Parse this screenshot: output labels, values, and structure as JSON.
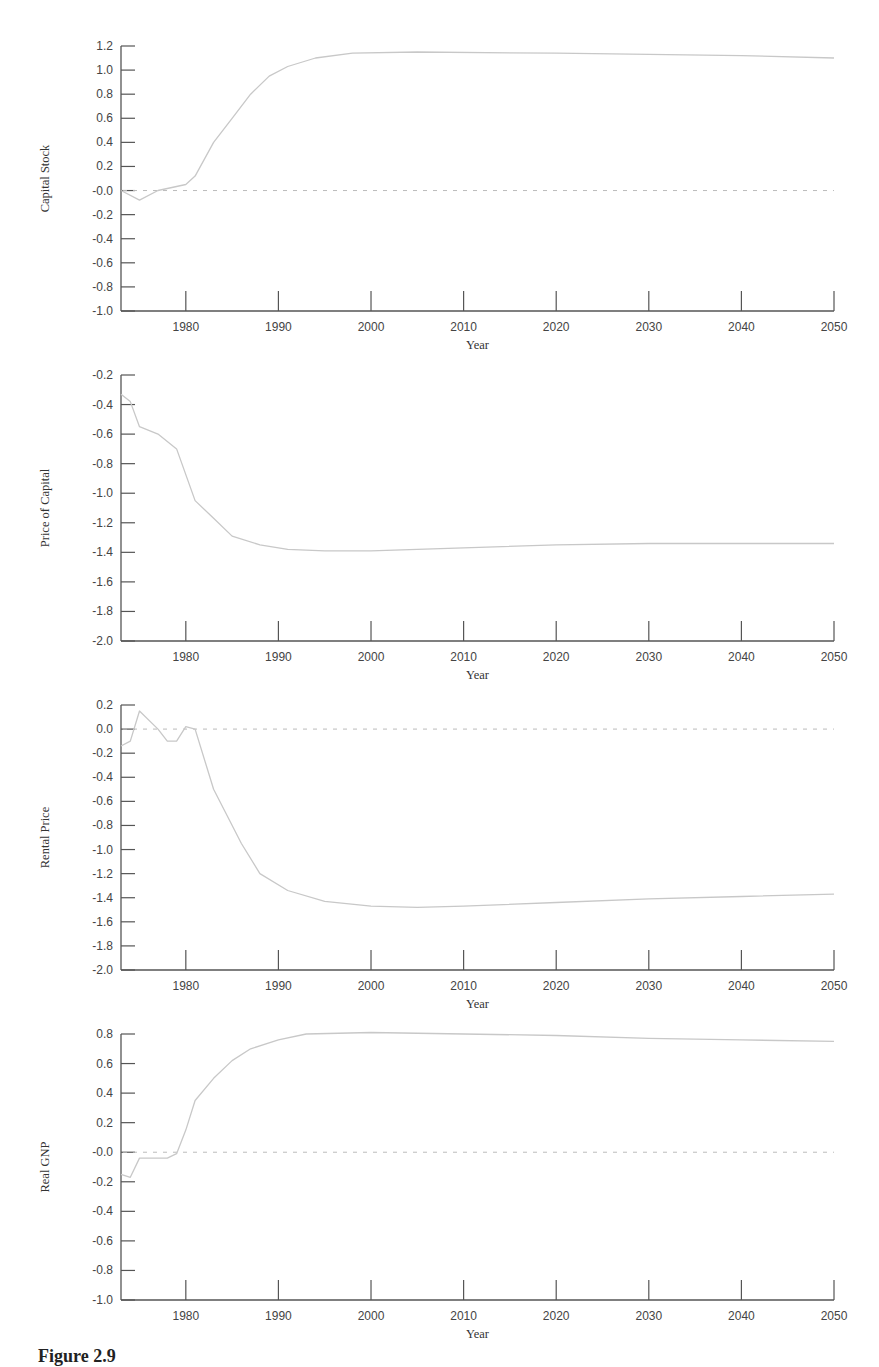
{
  "caption": "Figure 2.9",
  "chart_data": [
    {
      "type": "line",
      "title": "",
      "xlabel": "Year",
      "ylabel": "Capital Stock",
      "xlim": [
        1973,
        2050
      ],
      "ylim": [
        -1.0,
        1.2
      ],
      "yticks": [
        "1.2",
        "1.0",
        "0.8",
        "0.6",
        "0.4",
        "0.2",
        "-0.0",
        "-0.2",
        "-0.4",
        "-0.6",
        "-0.8",
        "-1.0"
      ],
      "xticks": [
        "1980",
        "1990",
        "2000",
        "2010",
        "2020",
        "2030",
        "2040",
        "2050"
      ],
      "zero_line": true,
      "grid": false,
      "x": [
        1973,
        1975,
        1977,
        1980,
        1981,
        1983,
        1985,
        1987,
        1989,
        1991,
        1994,
        1998,
        2005,
        2020,
        2030,
        2040,
        2050
      ],
      "values": [
        0.0,
        -0.08,
        0.0,
        0.05,
        0.12,
        0.4,
        0.6,
        0.8,
        0.95,
        1.03,
        1.1,
        1.14,
        1.15,
        1.14,
        1.13,
        1.12,
        1.1
      ]
    },
    {
      "type": "line",
      "title": "",
      "xlabel": "Year",
      "ylabel": "Price of Capital",
      "xlim": [
        1973,
        2050
      ],
      "ylim": [
        -2.0,
        -0.2
      ],
      "yticks": [
        "-0.2",
        "-0.4",
        "-0.6",
        "-0.8",
        "-1.0",
        "-1.2",
        "-1.4",
        "-1.6",
        "-1.8",
        "-2.0"
      ],
      "xticks": [
        "1980",
        "1990",
        "2000",
        "2010",
        "2020",
        "2030",
        "2040",
        "2050"
      ],
      "zero_line": false,
      "grid": false,
      "x": [
        1973,
        1974,
        1975,
        1977,
        1979,
        1981,
        1983,
        1985,
        1988,
        1991,
        1995,
        2000,
        2005,
        2010,
        2020,
        2030,
        2040,
        2050
      ],
      "values": [
        -0.33,
        -0.38,
        -0.55,
        -0.6,
        -0.7,
        -1.05,
        -1.17,
        -1.29,
        -1.35,
        -1.38,
        -1.39,
        -1.39,
        -1.38,
        -1.37,
        -1.35,
        -1.34,
        -1.34,
        -1.34
      ]
    },
    {
      "type": "line",
      "title": "",
      "xlabel": "Year",
      "ylabel": "Rental Price",
      "xlim": [
        1973,
        2050
      ],
      "ylim": [
        -2.0,
        0.2
      ],
      "yticks": [
        "0.2",
        "0.0",
        "-0.2",
        "-0.4",
        "-0.6",
        "-0.8",
        "-1.0",
        "-1.2",
        "-1.4",
        "-1.6",
        "-1.8",
        "-2.0"
      ],
      "xticks": [
        "1980",
        "1990",
        "2000",
        "2010",
        "2020",
        "2030",
        "2040",
        "2050"
      ],
      "zero_line": true,
      "grid": false,
      "x": [
        1973,
        1974,
        1975,
        1977,
        1978,
        1979,
        1980,
        1981,
        1983,
        1986,
        1988,
        1991,
        1995,
        2000,
        2005,
        2010,
        2020,
        2030,
        2040,
        2050
      ],
      "values": [
        -0.14,
        -0.1,
        0.15,
        0.0,
        -0.1,
        -0.1,
        0.02,
        0.0,
        -0.5,
        -0.95,
        -1.2,
        -1.34,
        -1.43,
        -1.47,
        -1.48,
        -1.47,
        -1.44,
        -1.41,
        -1.39,
        -1.37
      ]
    },
    {
      "type": "line",
      "title": "",
      "xlabel": "Year",
      "ylabel": "Real GNP",
      "xlim": [
        1973,
        2050
      ],
      "ylim": [
        -1.0,
        0.8
      ],
      "yticks": [
        "0.8",
        "0.6",
        "0.4",
        "0.2",
        "-0.0",
        "-0.2",
        "-0.4",
        "-0.6",
        "-0.8",
        "-1.0"
      ],
      "xticks": [
        "1980",
        "1990",
        "2000",
        "2010",
        "2020",
        "2030",
        "2040",
        "2050"
      ],
      "zero_line": true,
      "grid": false,
      "x": [
        1973,
        1974,
        1975,
        1978,
        1979,
        1980,
        1981,
        1983,
        1985,
        1987,
        1990,
        1993,
        2000,
        2010,
        2020,
        2030,
        2040,
        2050
      ],
      "values": [
        -0.15,
        -0.17,
        -0.04,
        -0.04,
        -0.01,
        0.15,
        0.35,
        0.5,
        0.62,
        0.7,
        0.76,
        0.8,
        0.81,
        0.8,
        0.79,
        0.77,
        0.76,
        0.75
      ]
    }
  ],
  "layout": {
    "panels": [
      {
        "top": 46,
        "bottom": 311
      },
      {
        "top": 375,
        "bottom": 641
      },
      {
        "top": 705,
        "bottom": 970
      },
      {
        "top": 1034,
        "bottom": 1300
      }
    ],
    "x_left": 121,
    "x_right": 834,
    "line_color": "#c8c8c8",
    "axis_color": "#555555",
    "zero_color": "#bbbbbb"
  }
}
